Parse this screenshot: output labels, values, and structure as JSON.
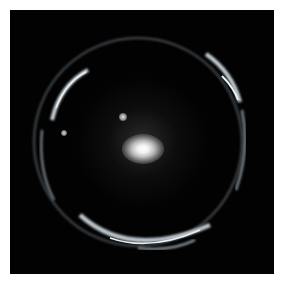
{
  "image": {
    "subject": "Einstein ring gravitational lens",
    "background_color": "#020202",
    "page_background": "#ffffff",
    "elements": {
      "lens_galaxy": "bright elliptical galaxy at center",
      "ring": "partial bluish-white arcs forming a ring around the galaxy",
      "point_sources": [
        "small star upper-left of galaxy",
        "small star left inside ring"
      ]
    }
  }
}
